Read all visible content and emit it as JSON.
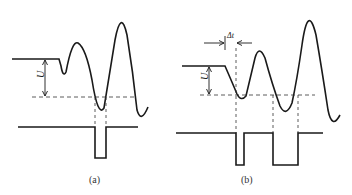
{
  "diagram": {
    "panels": [
      {
        "id": "a",
        "caption": "(a)",
        "amplitude_label": "U"
      },
      {
        "id": "b",
        "caption": "(b)",
        "amplitude_label": "U",
        "time_label": "Δt"
      }
    ],
    "colors": {
      "stroke": "#1a1a1a",
      "dashed": "#333333",
      "background": "#ffffff"
    }
  }
}
